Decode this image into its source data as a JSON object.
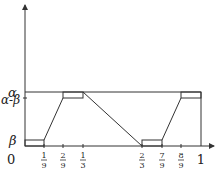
{
  "diagram": {
    "y_labels": {
      "alpha": "α",
      "alpha_minus_beta": "α-β",
      "beta": "β",
      "zero": "0"
    },
    "x_ticks": [
      {
        "num": "1",
        "den": "9",
        "x": 44
      },
      {
        "num": "2",
        "den": "9",
        "x": 63
      },
      {
        "num": "1",
        "den": "3",
        "x": 83
      },
      {
        "num": "2",
        "den": "3",
        "x": 142
      },
      {
        "num": "7",
        "den": "9",
        "x": 162
      },
      {
        "num": "8",
        "den": "9",
        "x": 181
      }
    ],
    "x_end_label": "1",
    "stroke_color": "#333333"
  }
}
